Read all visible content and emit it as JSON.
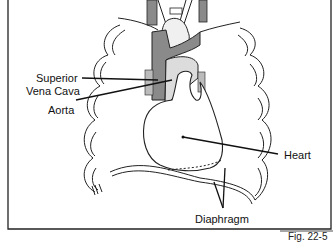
{
  "figure": {
    "caption_partial": "Fig. 22-5",
    "labels": {
      "superior_vena_cava_line1": "Superior",
      "superior_vena_cava_line2": "Vena Cava",
      "aorta": "Aorta",
      "heart": "Heart",
      "diaphragm": "Diaphragm"
    }
  },
  "colors": {
    "vessel_dark": "#8a8a8a",
    "aorta_fill": "#dcdcdc",
    "line": "#111111",
    "background": "#ffffff"
  }
}
